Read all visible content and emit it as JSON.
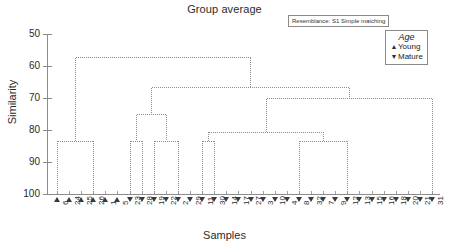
{
  "chart_data": {
    "type": "line",
    "title": "Group average",
    "xlabel": "Samples",
    "ylabel": "Similarity",
    "ylim": [
      50,
      100
    ],
    "y_inverted": true,
    "yticks": [
      50,
      60,
      70,
      80,
      90,
      100
    ],
    "grid": false,
    "resemblance": "Resemblance: S1 Simple matching",
    "legend": {
      "position": "top-right",
      "title": "Age",
      "entries": [
        {
          "symbol": "up-triangle",
          "label": "Young"
        },
        {
          "symbol": "down-triangle",
          "label": "Mature"
        }
      ]
    },
    "samples": [
      {
        "label": "6",
        "age": "Young"
      },
      {
        "label": "24",
        "age": "Young"
      },
      {
        "label": "25",
        "age": "Young"
      },
      {
        "label": "26",
        "age": "Young"
      },
      {
        "label": "1",
        "age": "Young"
      },
      {
        "label": "5",
        "age": "Young"
      },
      {
        "label": "23",
        "age": "Mature"
      },
      {
        "label": "28",
        "age": "Mature"
      },
      {
        "label": "19",
        "age": "Mature"
      },
      {
        "label": "22",
        "age": "Mature"
      },
      {
        "label": "2",
        "age": "Mature"
      },
      {
        "label": "29",
        "age": "Mature"
      },
      {
        "label": "11",
        "age": "Mature"
      },
      {
        "label": "30",
        "age": "Mature"
      },
      {
        "label": "14",
        "age": "Mature"
      },
      {
        "label": "17",
        "age": "Mature"
      },
      {
        "label": "27",
        "age": "Mature"
      },
      {
        "label": "3",
        "age": "Mature"
      },
      {
        "label": "10",
        "age": "Mature"
      },
      {
        "label": "4",
        "age": "Mature"
      },
      {
        "label": "8",
        "age": "Mature"
      },
      {
        "label": "32",
        "age": "Mature"
      },
      {
        "label": "7",
        "age": "Mature"
      },
      {
        "label": "9",
        "age": "Mature"
      },
      {
        "label": "12",
        "age": "Mature"
      },
      {
        "label": "13",
        "age": "Mature"
      },
      {
        "label": "15",
        "age": "Mature"
      },
      {
        "label": "16",
        "age": "Mature"
      },
      {
        "label": "18",
        "age": "Mature"
      },
      {
        "label": "20",
        "age": "Mature"
      },
      {
        "label": "21",
        "age": "Mature"
      },
      {
        "label": "31",
        "age": "Mature"
      }
    ],
    "merges": [
      {
        "id": "m1",
        "left": {
          "leaf": 0
        },
        "right": {
          "leaf": 3
        },
        "similarity": 83.3
      },
      {
        "id": "m2",
        "left": {
          "leaf": 6
        },
        "right": {
          "leaf": 7
        },
        "similarity": 83.3
      },
      {
        "id": "m3",
        "left": {
          "leaf": 8
        },
        "right": {
          "leaf": 10
        },
        "similarity": 83.3
      },
      {
        "id": "m4",
        "left": {
          "node": "m2"
        },
        "right": {
          "node": "m3"
        },
        "similarity": 75.0
      },
      {
        "id": "m5",
        "left": {
          "leaf": 12
        },
        "right": {
          "leaf": 13
        },
        "similarity": 83.3
      },
      {
        "id": "m6",
        "left": {
          "leaf": 20
        },
        "right": {
          "leaf": 24
        },
        "similarity": 83.3
      },
      {
        "id": "m7",
        "left": {
          "node": "m5"
        },
        "right": {
          "node": "m6"
        },
        "similarity": 80.6
      },
      {
        "id": "m8",
        "left": {
          "node": "m7"
        },
        "right": {
          "leaf": 31
        },
        "similarity": 70.0
      },
      {
        "id": "m9",
        "left": {
          "node": "m4"
        },
        "right": {
          "node": "m8"
        },
        "similarity": 66.7
      },
      {
        "id": "m10",
        "left": {
          "node": "m1"
        },
        "right": {
          "node": "m9"
        },
        "similarity": 57.2
      }
    ],
    "line_color": "#8c8c8c",
    "axis_color": "#8c8c8c",
    "symbol_color": "#3a3a3a"
  }
}
